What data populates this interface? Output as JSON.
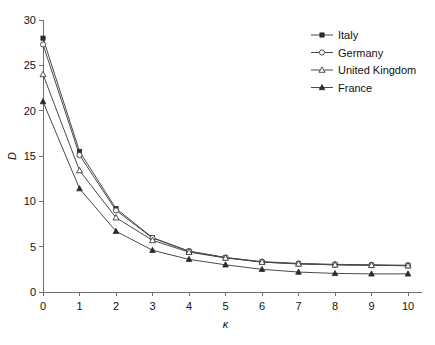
{
  "chart_data": {
    "type": "line",
    "title": "",
    "subtitle": "",
    "xlabel": "κ",
    "ylabel": "D",
    "x": [
      0,
      1,
      2,
      3,
      4,
      5,
      6,
      7,
      8,
      9,
      10
    ],
    "xlim": [
      0,
      10
    ],
    "ylim": [
      0,
      30
    ],
    "xticks": [
      "0",
      "1",
      "2",
      "3",
      "4",
      "5",
      "6",
      "7",
      "8",
      "9",
      "10"
    ],
    "yticks": [
      "0",
      "5",
      "10",
      "15",
      "20",
      "25",
      "30"
    ],
    "grid": false,
    "legend_position": "top-right",
    "series": [
      {
        "name": "Italy",
        "marker": "filled-square",
        "values": [
          28.0,
          15.5,
          9.2,
          6.0,
          4.5,
          3.8,
          3.3,
          3.1,
          3.0,
          2.95,
          2.9
        ]
      },
      {
        "name": "Germany",
        "marker": "open-circle",
        "values": [
          27.3,
          15.1,
          9.0,
          5.95,
          4.5,
          3.8,
          3.35,
          3.15,
          3.05,
          3.0,
          2.95
        ]
      },
      {
        "name": "United Kingdom",
        "marker": "open-triangle",
        "values": [
          24.0,
          13.4,
          8.2,
          5.7,
          4.4,
          3.75,
          3.3,
          3.1,
          3.0,
          2.95,
          2.9
        ]
      },
      {
        "name": "France",
        "marker": "filled-triangle",
        "values": [
          21.0,
          11.4,
          6.7,
          4.6,
          3.6,
          3.0,
          2.5,
          2.2,
          2.05,
          2.0,
          2.0
        ]
      }
    ],
    "colors": {
      "line": "#4a4a4a",
      "axis": "#6e6e6e",
      "text": "#111111",
      "background": "#ffffff"
    }
  }
}
